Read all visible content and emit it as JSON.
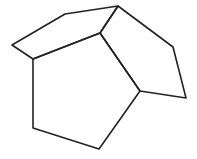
{
  "diagram": {
    "title": "",
    "stroke_color": "#222222",
    "background": "#ffffff",
    "vertices": {
      "A": [
        12,
        45
      ],
      "B": [
        65,
        14
      ],
      "C": [
        118,
        6
      ],
      "D": [
        100,
        33
      ],
      "E": [
        33,
        59
      ],
      "F": [
        33,
        128
      ],
      "G": [
        99,
        149
      ],
      "H": [
        140,
        91
      ],
      "I": [
        186,
        98
      ],
      "J": [
        173,
        47
      ]
    },
    "faces": [
      {
        "name": "top-left-pentagon",
        "vertices": [
          "A",
          "B",
          "C",
          "D",
          "E"
        ]
      },
      {
        "name": "bottom-pentagon",
        "vertices": [
          "E",
          "D",
          "H",
          "G",
          "F"
        ]
      },
      {
        "name": "right-pentagon",
        "vertices": [
          "D",
          "C",
          "J",
          "I",
          "H"
        ]
      }
    ]
  }
}
